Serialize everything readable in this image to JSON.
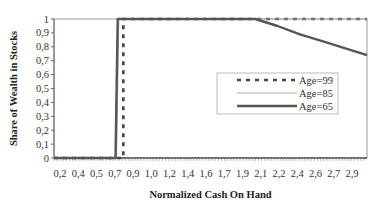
{
  "chart_data": {
    "type": "line",
    "title": "",
    "xlabel": "Normalized Cash On Hand",
    "ylabel": "Share of Wealth in Stocks",
    "ylim": [
      0,
      1
    ],
    "xlim": [
      0.2,
      3.0
    ],
    "y_ticks": [
      "0",
      "0,1",
      "0,2",
      "0,3",
      "0,4",
      "0,5",
      "0,6",
      "0,7",
      "0,8",
      "0,9",
      "1"
    ],
    "x_ticks": [
      "0,2",
      "0,4",
      "0,5",
      "0,7",
      "0,9",
      "1,0",
      "1,2",
      "1,4",
      "1,6",
      "1,7",
      "1,9",
      "2,1",
      "2,2",
      "2,4",
      "2,6",
      "2,7",
      "2,9"
    ],
    "grid": false,
    "legend_position": "inside right",
    "series": [
      {
        "name": "Age=99",
        "style": "dashed",
        "x": [
          0.2,
          0.82,
          0.82,
          3.0
        ],
        "y": [
          0,
          0,
          1,
          1
        ]
      },
      {
        "name": "Age=85",
        "style": "thin",
        "x": [
          0.2,
          0.76,
          0.78,
          3.0
        ],
        "y": [
          0,
          0,
          1,
          1
        ]
      },
      {
        "name": "Age=65",
        "style": "thick",
        "x": [
          0.2,
          0.75,
          0.77,
          2.0,
          2.2,
          2.4,
          2.6,
          2.8,
          3.0
        ],
        "y": [
          0,
          0,
          1,
          1,
          0.95,
          0.89,
          0.84,
          0.79,
          0.74
        ]
      }
    ]
  }
}
